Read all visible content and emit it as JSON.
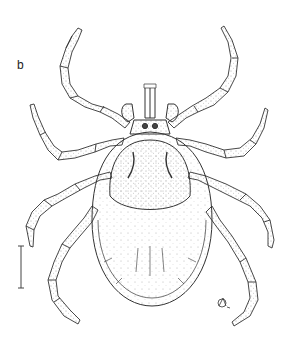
{
  "figure": {
    "panel_label": "b",
    "signature": "artist monogram",
    "scale_bar": "vertical scale bar",
    "colors": {
      "ink": "#333333",
      "background": "#ffffff"
    }
  }
}
